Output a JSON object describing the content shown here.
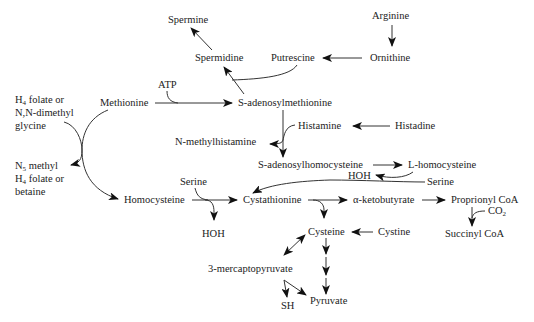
{
  "diagram": {
    "type": "metabolic-pathway",
    "nodes": {
      "spermine": "Spermine",
      "spermidine": "Spermidine",
      "putrescine": "Putrescine",
      "ornithine": "Ornithine",
      "arginine": "Arginine",
      "atp": "ATP",
      "methionine": "Methionine",
      "sam": "S-adenosylmethionine",
      "h4folate_a": "H",
      "h4folate_a_sub": "4",
      "h4folate_a_rest": " folate or",
      "nn_dimethyl": "N,N-dimethyl",
      "glycine": "glycine",
      "n5_a": "N",
      "n5_sub": "5",
      "n5_rest": " methyl",
      "h4folate_b": "H",
      "h4folate_b_sub": "4",
      "h4folate_b_rest": " folate or",
      "betaine": "betaine",
      "histamine": "Histamine",
      "histadine": "Histadine",
      "n_methylhistamine": "N-methylhistamine",
      "sah": "S-adenosylhomocysteine",
      "l_homocysteine": "L-homocysteine",
      "hoh_top": "HOH",
      "serine_right": "Serine",
      "serine_left": "Serine",
      "homocysteine": "Homocysteine",
      "cystathionine": "Cystathionine",
      "alpha_ketobutyrate": "α-ketobutyrate",
      "proprionyl_coa": "Proprionyl CoA",
      "co2": "CO",
      "co2_sub": "2",
      "succinyl_coa": "Succinyl CoA",
      "hoh_bottom": "HOH",
      "cysteine": "Cysteine",
      "cystine": "Cystine",
      "mercaptopyruvate": "3-mercaptopyruvate",
      "sh": "SH",
      "pyruvate": "Pyruvate"
    },
    "edges": [
      {
        "from": "Arginine",
        "to": "Ornithine"
      },
      {
        "from": "Ornithine",
        "to": "Putrescine"
      },
      {
        "from": "Putrescine",
        "to": "Spermidine",
        "cofactor": "S-adenosylmethionine"
      },
      {
        "from": "Spermidine",
        "to": "Spermine"
      },
      {
        "from": "Methionine",
        "to": "S-adenosylmethionine",
        "cofactor": "ATP"
      },
      {
        "from": "S-adenosylmethionine",
        "to": "S-adenosylhomocysteine",
        "cofactor": "Histamine -> N-methylhistamine"
      },
      {
        "from": "Histadine",
        "to": "Histamine"
      },
      {
        "from": "S-adenosylhomocysteine",
        "to": "L-homocysteine"
      },
      {
        "from": "L-homocysteine",
        "to": "Cystathionine",
        "cofactor": "Serine -> HOH"
      },
      {
        "from": "Homocysteine",
        "to": "Methionine",
        "cofactor": "N5 methyl H4 folate or betaine -> H4 folate or N,N-dimethyl glycine"
      },
      {
        "from": "Homocysteine",
        "to": "Cystathionine",
        "cofactor": "Serine -> HOH"
      },
      {
        "from": "Cystathionine",
        "to": "α-ketobutyrate"
      },
      {
        "from": "Cystathionine",
        "to": "Cysteine"
      },
      {
        "from": "α-ketobutyrate",
        "to": "Proprionyl CoA"
      },
      {
        "from": "Proprionyl CoA",
        "to": "Succinyl CoA",
        "cofactor": "CO2"
      },
      {
        "from": "Cystine",
        "to": "Cysteine"
      },
      {
        "from": "Cysteine",
        "to": "3-mercaptopyruvate",
        "bidirectional": true
      },
      {
        "from": "Cysteine",
        "to": "Pyruvate"
      },
      {
        "from": "3-mercaptopyruvate",
        "to": "Pyruvate",
        "cofactor": "SH"
      }
    ]
  }
}
